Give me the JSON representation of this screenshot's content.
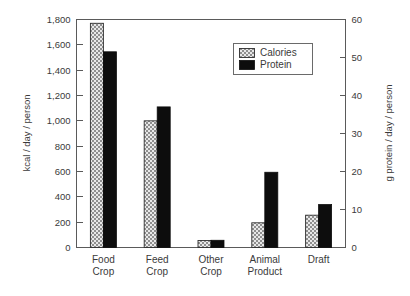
{
  "chart_data": {
    "type": "bar",
    "title": "",
    "subtitle": "",
    "categories": [
      "Food Crop",
      "Feed Crop",
      "Other Crop",
      "Animal Product",
      "Draft"
    ],
    "category_lines": [
      [
        "Food",
        "Crop"
      ],
      [
        "Feed",
        "Crop"
      ],
      [
        "Other",
        "Crop"
      ],
      [
        "Animal",
        "Product"
      ],
      [
        "Draft",
        ""
      ]
    ],
    "series": [
      {
        "name": "Calories",
        "axis": "left",
        "units": "kcal / day / person",
        "values": [
          1770,
          1000,
          55,
          195,
          255
        ],
        "fill": "gray-crosshatch",
        "color": "#9a9a9a"
      },
      {
        "name": "Protein",
        "axis": "right",
        "units": "g protein / day / person",
        "values": [
          51.5,
          37.0,
          1.9,
          19.8,
          11.3
        ],
        "fill": "solid",
        "color": "#0d0d0d"
      }
    ],
    "xlabel": "",
    "ylabel": "kcal / day / person",
    "ylabel_right": "g protein / day / person",
    "ylim": [
      0,
      1800
    ],
    "ylim_right": [
      0,
      60
    ],
    "yticks": [
      0,
      200,
      400,
      600,
      800,
      1000,
      1200,
      1400,
      1600,
      1800
    ],
    "ytick_labels": [
      "0",
      "200",
      "400",
      "600",
      "800",
      "1,000",
      "1,200",
      "1,400",
      "1,600",
      "1,800"
    ],
    "yticks_right": [
      0,
      10,
      20,
      30,
      40,
      50,
      60
    ],
    "ytick_labels_right": [
      "0",
      "10",
      "20",
      "30",
      "40",
      "50",
      "60"
    ],
    "grid": false,
    "legend_position": "top-right",
    "legend_entries": [
      "Calories",
      "Protein"
    ],
    "background_color": "#ffffff",
    "axis_color": "#5a5a5a"
  },
  "legend": {
    "calories_label": "Calories",
    "protein_label": "Protein"
  },
  "axes": {
    "left_title": "kcal / day / person",
    "right_title": "g protein / day / person"
  }
}
